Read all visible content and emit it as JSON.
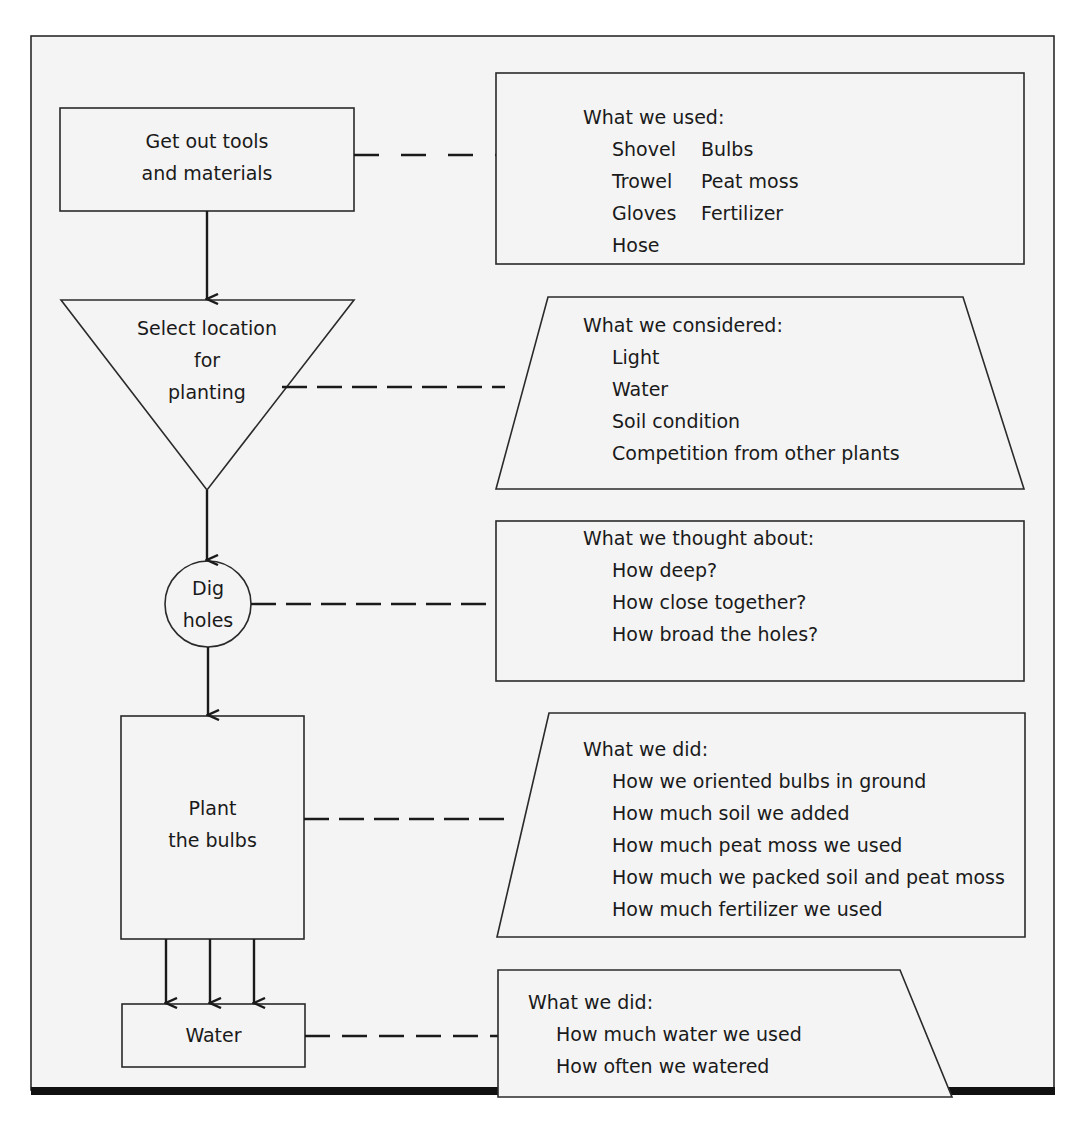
{
  "colors": {
    "frame_fill": "#f4f4f4",
    "stroke": "#2a2a2a",
    "text": "#1a1a1a",
    "bottom_rule": "#111111"
  },
  "flow": {
    "steps": [
      {
        "id": "tools",
        "shape": "rectangle",
        "lines": [
          "Get out tools",
          "and materials"
        ]
      },
      {
        "id": "location",
        "shape": "inverted-triangle",
        "lines": [
          "Select location",
          "for",
          "planting"
        ]
      },
      {
        "id": "dig",
        "shape": "circle",
        "lines": [
          "Dig",
          "holes"
        ]
      },
      {
        "id": "plant",
        "shape": "rectangle",
        "lines": [
          "Plant",
          "the bulbs"
        ]
      },
      {
        "id": "water",
        "shape": "rectangle",
        "lines": [
          "Water"
        ]
      }
    ]
  },
  "notes": [
    {
      "id": "used",
      "shape": "rectangle",
      "title": "What we used:",
      "columns": [
        [
          "Shovel",
          "Trowel",
          "Gloves",
          "Hose"
        ],
        [
          "Bulbs",
          "Peat moss",
          "Fertilizer"
        ]
      ]
    },
    {
      "id": "considered",
      "shape": "trapezoid",
      "title": "What we considered:",
      "items": [
        "Light",
        "Water",
        "Soil condition",
        "Competition from other plants"
      ]
    },
    {
      "id": "thought",
      "shape": "rectangle",
      "title": "What we thought about:",
      "items": [
        "How deep?",
        "How close together?",
        "How broad the holes?"
      ]
    },
    {
      "id": "did-plant",
      "shape": "left-slanted-quad",
      "title": "What we did:",
      "items": [
        "How we oriented bulbs in ground",
        "How much soil we added",
        "How much peat moss we used",
        "How much we packed soil and peat moss",
        "How much fertilizer we used"
      ]
    },
    {
      "id": "did-water",
      "shape": "right-slanted-quad",
      "title": "What we did:",
      "items": [
        "How much water we used",
        "How often we watered"
      ]
    }
  ]
}
